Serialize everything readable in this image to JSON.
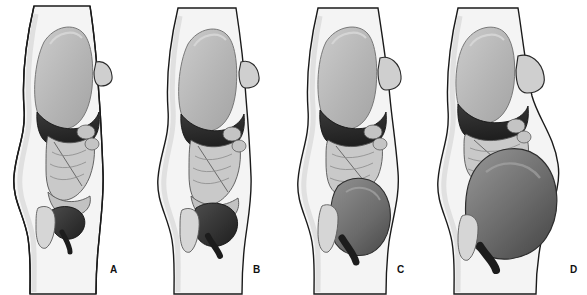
{
  "figure": {
    "background_color": "#ffffff",
    "width": 587,
    "height": 295,
    "panel_count": 4
  },
  "palette": {
    "outline": "#1a1a1a",
    "skin_fill": "#f2f2f2",
    "body_shadow": "#e4e4e4",
    "lung_fill": "#b8b8b8",
    "lung_highlight": "#cfcfcf",
    "breast_fill": "#cfcfcf",
    "liver_dark": "#2b2b2b",
    "liver_mid": "#3d3d3d",
    "intestine_fill": "#c9c9c9",
    "intestine_line": "#4a4a4a",
    "colon_fill": "#bfbfbf",
    "uterus_dark": "#272727",
    "uterus_mid": "#6f6f6f",
    "uterus_light": "#8a8a8a",
    "bladder_fill": "#d4d4d4",
    "label_color": "#111111"
  },
  "panels": [
    {
      "id": "panel-a",
      "label": "A",
      "stage": "non-pregnant",
      "label_x": 110,
      "label_y": 271,
      "offset_x": 0,
      "structures": [
        {
          "name": "body-outline",
          "tone": "skin"
        },
        {
          "name": "lung-thorax",
          "tone": "light-gray"
        },
        {
          "name": "breast",
          "tone": "light-gray",
          "size": "small"
        },
        {
          "name": "liver-diaphragm-band",
          "tone": "dark"
        },
        {
          "name": "small-intestine",
          "tone": "mid-gray"
        },
        {
          "name": "colon",
          "tone": "mid-gray"
        },
        {
          "name": "uterus",
          "tone": "dark",
          "size": "small"
        },
        {
          "name": "bladder",
          "tone": "light-gray"
        }
      ]
    },
    {
      "id": "panel-b",
      "label": "B",
      "stage": "first-trimester",
      "label_x": 253,
      "label_y": 271,
      "offset_x": 146,
      "structures": [
        {
          "name": "body-outline",
          "tone": "skin"
        },
        {
          "name": "lung-thorax",
          "tone": "light-gray"
        },
        {
          "name": "breast",
          "tone": "light-gray",
          "size": "small"
        },
        {
          "name": "liver-diaphragm-band",
          "tone": "dark"
        },
        {
          "name": "small-intestine",
          "tone": "mid-gray"
        },
        {
          "name": "colon",
          "tone": "mid-gray"
        },
        {
          "name": "uterus",
          "tone": "dark",
          "size": "enlarged"
        },
        {
          "name": "bladder",
          "tone": "light-gray"
        }
      ]
    },
    {
      "id": "panel-c",
      "label": "C",
      "stage": "second-trimester",
      "label_x": 397,
      "label_y": 271,
      "offset_x": 288,
      "structures": [
        {
          "name": "body-outline",
          "tone": "skin"
        },
        {
          "name": "lung-thorax",
          "tone": "light-gray"
        },
        {
          "name": "breast",
          "tone": "light-gray",
          "size": "medium"
        },
        {
          "name": "liver-diaphragm-band",
          "tone": "dark"
        },
        {
          "name": "small-intestine",
          "tone": "mid-gray"
        },
        {
          "name": "colon",
          "tone": "mid-gray"
        },
        {
          "name": "gravid-uterus",
          "tone": "mid-dark",
          "size": "large"
        },
        {
          "name": "bladder",
          "tone": "light-gray"
        }
      ]
    },
    {
      "id": "panel-d",
      "label": "D",
      "stage": "third-trimester",
      "label_x": 570,
      "label_y": 271,
      "offset_x": 428,
      "structures": [
        {
          "name": "body-outline",
          "tone": "skin"
        },
        {
          "name": "lung-thorax",
          "tone": "light-gray"
        },
        {
          "name": "breast",
          "tone": "light-gray",
          "size": "large"
        },
        {
          "name": "liver-diaphragm-band",
          "tone": "dark"
        },
        {
          "name": "small-intestine",
          "tone": "mid-gray"
        },
        {
          "name": "colon",
          "tone": "mid-gray"
        },
        {
          "name": "gravid-uterus",
          "tone": "mid-dark",
          "size": "very-large"
        },
        {
          "name": "bladder",
          "tone": "light-gray"
        }
      ]
    }
  ]
}
